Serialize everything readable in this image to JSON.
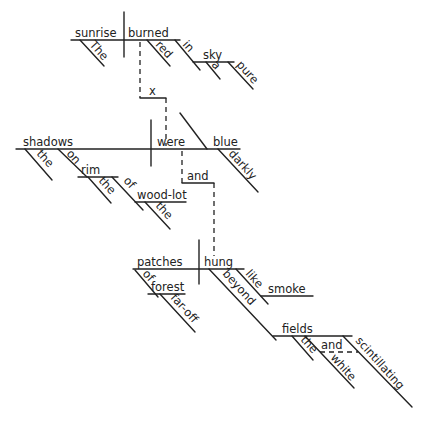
{
  "diagram": {
    "type": "sentence-diagram",
    "clauses": [
      {
        "id": "clause-1",
        "subject": "sunrise",
        "verb": "burned",
        "modifiers": {
          "subject_article": "The",
          "predicate_adjective": "red",
          "preposition": "in",
          "object": "sky",
          "object_article": "a",
          "object_adjective": "pure"
        }
      },
      {
        "id": "clause-2",
        "subject": "shadows",
        "verb": "were",
        "complement": "blue",
        "modifiers": {
          "subject_article": "the",
          "preposition": "on",
          "object": "rim",
          "object_article": "the",
          "preposition_2": "of",
          "object_2": "wood-lot",
          "object_2_article": "the",
          "complement_adverb": "darkly"
        }
      },
      {
        "id": "clause-3",
        "subject": "patches",
        "verb": "hung",
        "modifiers": {
          "preposition": "of",
          "object": "forest",
          "object_adjective": "far-off",
          "preposition_like": "like",
          "object_like": "smoke",
          "preposition_beyond": "beyond",
          "object_beyond": "fields",
          "object_beyond_article": "the",
          "object_beyond_adj_1": "white",
          "object_beyond_conj": "and",
          "object_beyond_adj_2": "scintillating"
        }
      }
    ],
    "connectors": {
      "clause_1_2": "x",
      "clause_2_3": "and"
    }
  }
}
